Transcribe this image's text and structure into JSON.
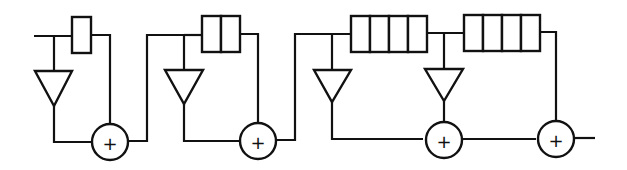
{
  "diagram": {
    "type": "signal-flow block diagram (cascaded comb filter with delay lines)",
    "stages": [
      {
        "id": "stage-1",
        "delay_cells": 1,
        "multipliers": 1,
        "adder_symbol": "+"
      },
      {
        "id": "stage-2",
        "delay_cells": 2,
        "multipliers": 1,
        "adder_symbol": "+"
      },
      {
        "id": "stage-3",
        "delay_cells": 4,
        "multipliers": 2,
        "adder_symbol": "+"
      },
      {
        "id": "stage-4",
        "delay_cells": 4,
        "multipliers": 0,
        "adder_symbol": "+"
      }
    ],
    "adder_label": "+",
    "colors": {
      "stroke": "#111111",
      "background": "#ffffff"
    }
  }
}
